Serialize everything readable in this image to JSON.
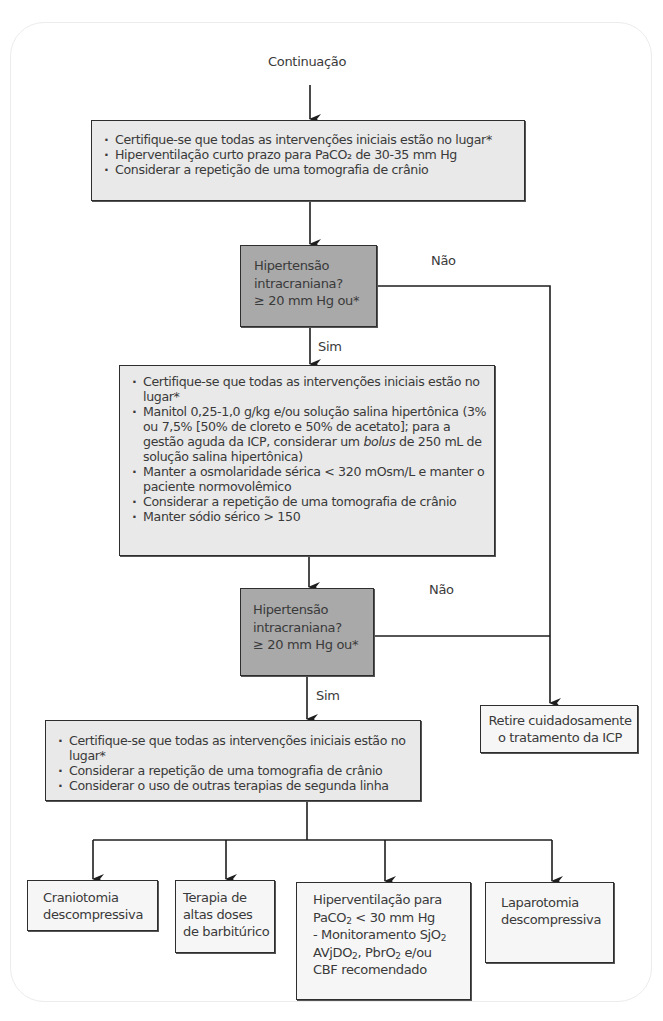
{
  "flowchart": {
    "start_label": "Continuação",
    "box1": {
      "items": [
        "Certifique-se que todas as intervenções iniciais estão no lugar*",
        "Hiperventilação curto prazo para PaCO₂ de 30-35 mm Hg",
        "Considerar a repetição de uma tomografia de crânio"
      ]
    },
    "decision1": {
      "line1": "Hipertensão",
      "line2": "intracraniana?",
      "line3": "≥ 20 mm Hg ou*",
      "no_label": "Não",
      "yes_label": "Sim"
    },
    "box2": {
      "items": [
        "Certifique-se que todas as intervenções iniciais estão no lugar*",
        "Manitol 0,25-1,0 g/kg e/ou solução salina hipertônica (3% ou 7,5% [50% de cloreto e 50% de acetato]; para a gestão aguda da ICP, considerar um bolus de 250 mL de solução salina hipertônica)",
        "Manter a osmolaridade sérica < 320 mOsm/L e manter o paciente normovolêmico",
        "Considerar a repetição de uma tomografia de crânio",
        "Manter sódio sérico > 150"
      ]
    },
    "decision2": {
      "line1": "Hipertensão",
      "line2": "intracraniana?",
      "line3": "≥ 20 mm Hg ou*",
      "no_label": "Não",
      "yes_label": "Sim"
    },
    "withdraw_box": {
      "line1": "Retire cuidadosamente",
      "line2": "o tratamento da ICP"
    },
    "box3": {
      "items": [
        "Certifique-se que todas as intervenções iniciais estão no lugar*",
        "Considerar a repetição de uma tomografia de crânio",
        "Considerar o uso de outras terapias de segunda linha"
      ]
    },
    "options": [
      {
        "lines": [
          "Craniotomia",
          "descompressiva"
        ]
      },
      {
        "lines": [
          "Terapia de",
          "altas doses",
          "de barbitúrico"
        ]
      },
      {
        "lines": [
          "Hiperventilação para",
          "PaCO₂ < 30 mm Hg",
          "- Monitoramento SjO₂",
          "AVjDO₂, PbrO₂ e/ou",
          "CBF recomendado"
        ]
      },
      {
        "lines": [
          "Laparotomia",
          "descompressiva"
        ]
      }
    ],
    "colors": {
      "process_fill": "#e9e9e9",
      "decision_fill": "#a9a9a9",
      "stroke": "#2e2e2e",
      "text": "#3a3a3a"
    }
  }
}
